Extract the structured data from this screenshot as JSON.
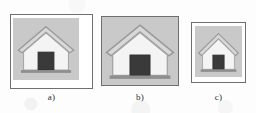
{
  "figure": {
    "background_color": "#fdfdfd",
    "panels": [
      {
        "id": "a",
        "caption": "a)",
        "frame_border_color": "#6f6f6f",
        "frame_background": "#ffffff",
        "raster_background": "#c9c9c9",
        "icon": "house-icon",
        "fill": "inset",
        "relative_scale": "small-inset"
      },
      {
        "id": "b",
        "caption": "b)",
        "frame_border_color": "#6f6f6f",
        "frame_background": "#c9c9c9",
        "raster_background": "#c9c9c9",
        "icon": "house-icon",
        "fill": "full",
        "relative_scale": "large"
      },
      {
        "id": "c",
        "caption": "c)",
        "frame_border_color": "#6f6f6f",
        "frame_background": "#ffffff",
        "raster_background": "#c9c9c9",
        "icon": "house-icon",
        "fill": "margin",
        "relative_scale": "small"
      }
    ],
    "icon_colors": {
      "wall": "#f2f2f2",
      "roof": "#d8d8d8",
      "outline": "#9a9a9a",
      "door": "#3a3a3a",
      "base": "#8f8f8f"
    }
  }
}
